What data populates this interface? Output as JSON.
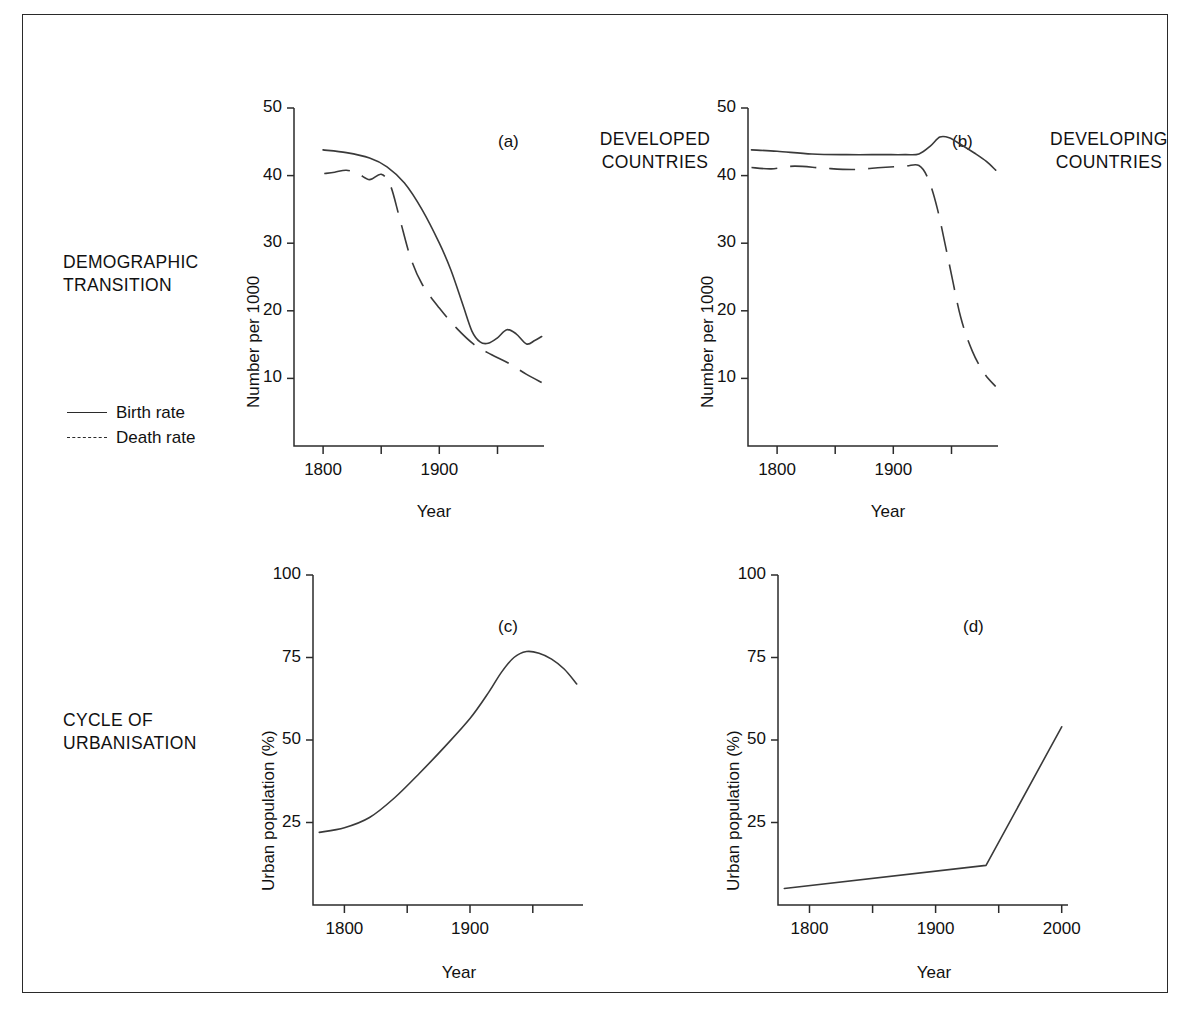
{
  "figure": {
    "row_labels": [
      {
        "id": "demographic",
        "text": "DEMOGRAPHIC\nTRANSITION"
      },
      {
        "id": "urbanisation",
        "text": "CYCLE OF\nURBANISATION"
      }
    ],
    "legend": {
      "items": [
        {
          "label": "Birth rate",
          "style": "solid"
        },
        {
          "label": "Death rate",
          "style": "dashed"
        }
      ]
    }
  },
  "chart_data": [
    {
      "id": "panel-a",
      "type": "line",
      "tag": "(a)",
      "title": "DEVELOPED\nCOUNTRIES",
      "xlabel": "Year",
      "ylabel": "Number per 1000",
      "xlim": [
        1775,
        1990
      ],
      "ylim": [
        0,
        50
      ],
      "xticks": [
        1800,
        1900,
        2000
      ],
      "xticks_minor": [
        1850,
        1950
      ],
      "xticklabels": [
        "1800",
        "1900",
        "2000"
      ],
      "yticks": [
        10,
        20,
        30,
        40,
        50
      ],
      "yticklabels": [
        "10",
        "20",
        "30",
        "40",
        "50"
      ],
      "grid": false,
      "series": [
        {
          "name": "Birth rate",
          "style": "solid",
          "x": [
            1800,
            1820,
            1840,
            1855,
            1870,
            1885,
            1900,
            1910,
            1920,
            1928,
            1935,
            1942,
            1950,
            1958,
            1966,
            1975,
            1982,
            1988
          ],
          "values": [
            43.8,
            43.4,
            42.6,
            41.3,
            38.9,
            35.0,
            30.0,
            26.0,
            21.0,
            17.0,
            15.4,
            15.2,
            16.0,
            17.2,
            16.6,
            15.1,
            15.6,
            16.2
          ]
        },
        {
          "name": "Death rate",
          "style": "dashed",
          "x": [
            1801,
            1810,
            1820,
            1830,
            1840,
            1850,
            1858,
            1866,
            1875,
            1885,
            1900,
            1915,
            1930,
            1945,
            1960,
            1975,
            1988
          ],
          "values": [
            40.3,
            40.5,
            40.8,
            40.3,
            39.4,
            40.2,
            38.5,
            33.6,
            28.0,
            24.0,
            20.4,
            17.4,
            15.0,
            13.5,
            12.2,
            10.6,
            9.4
          ]
        }
      ]
    },
    {
      "id": "panel-b",
      "type": "line",
      "tag": "(b)",
      "title": "DEVELOPING\nCOUNTRIES",
      "xlabel": "Year",
      "ylabel": "Number per 1000",
      "xlim": [
        1775,
        1990
      ],
      "ylim": [
        0,
        50
      ],
      "xticks": [
        1800,
        1900,
        2000
      ],
      "xticks_minor": [
        1850,
        1950
      ],
      "xticklabels": [
        "1800",
        "1900",
        "2000"
      ],
      "yticks": [
        10,
        20,
        30,
        40,
        50
      ],
      "yticklabels": [
        "10",
        "20",
        "30",
        "40",
        "50"
      ],
      "grid": false,
      "series": [
        {
          "name": "Birth rate",
          "style": "solid",
          "x": [
            1778,
            1800,
            1830,
            1860,
            1890,
            1910,
            1922,
            1932,
            1940,
            1948,
            1958,
            1970,
            1980,
            1988
          ],
          "values": [
            43.8,
            43.6,
            43.2,
            43.1,
            43.1,
            43.1,
            43.2,
            44.4,
            45.7,
            45.6,
            44.6,
            43.3,
            42.1,
            40.8
          ]
        },
        {
          "name": "Death rate",
          "style": "dashed",
          "x": [
            1778,
            1795,
            1815,
            1840,
            1865,
            1890,
            1910,
            1922,
            1930,
            1938,
            1948,
            1958,
            1968,
            1978,
            1988
          ],
          "values": [
            41.2,
            41.0,
            41.4,
            41.1,
            40.9,
            41.2,
            41.4,
            41.5,
            39.5,
            35.0,
            27.0,
            19.0,
            14.0,
            10.8,
            8.8
          ]
        }
      ]
    },
    {
      "id": "panel-c",
      "type": "line",
      "tag": "(c)",
      "title": "",
      "xlabel": "Year",
      "ylabel": "Urban population (%)",
      "xlim": [
        1775,
        1990
      ],
      "ylim": [
        0,
        100
      ],
      "xticks": [
        1800,
        1900,
        2000
      ],
      "xticks_minor": [
        1850,
        1950
      ],
      "xticklabels": [
        "1800",
        "1900",
        "2000"
      ],
      "yticks": [
        25,
        50,
        75,
        100
      ],
      "yticklabels": [
        "25",
        "50",
        "75",
        "100"
      ],
      "grid": false,
      "series": [
        {
          "name": "Urban population",
          "style": "solid",
          "x": [
            1780,
            1800,
            1820,
            1840,
            1860,
            1880,
            1900,
            1915,
            1925,
            1935,
            1945,
            1955,
            1965,
            1975,
            1985
          ],
          "values": [
            22.0,
            23.4,
            26.5,
            32.5,
            40.0,
            48.0,
            56.5,
            64.5,
            70.5,
            75.0,
            76.8,
            76.3,
            74.5,
            71.5,
            67.0
          ]
        }
      ]
    },
    {
      "id": "panel-d",
      "type": "line",
      "tag": "(d)",
      "title": "",
      "xlabel": "Year",
      "ylabel": "Urban population (%)",
      "xlim": [
        1775,
        2005
      ],
      "ylim": [
        0,
        100
      ],
      "xticks": [
        1800,
        1900,
        2000
      ],
      "xticks_minor": [
        1850,
        1950
      ],
      "xticklabels": [
        "1800",
        "1900",
        "2000"
      ],
      "yticks": [
        25,
        50,
        75,
        100
      ],
      "yticklabels": [
        "25",
        "50",
        "75",
        "100"
      ],
      "grid": false,
      "series": [
        {
          "name": "Urban population",
          "style": "solid",
          "x": [
            1780,
            1940,
            2000
          ],
          "values": [
            5.0,
            12.0,
            54.0
          ]
        }
      ]
    }
  ],
  "colors": {
    "line": "#3a3a3a",
    "axis": "#2b2b2b",
    "frame": "#2a2a2a",
    "background": "#ffffff"
  }
}
